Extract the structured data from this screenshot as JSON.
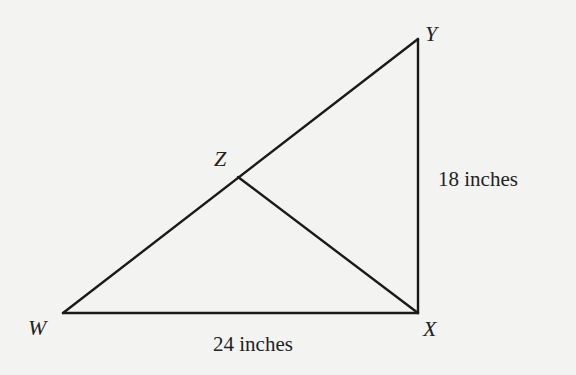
{
  "diagram": {
    "type": "triangle",
    "vertices": {
      "W": {
        "label": "W",
        "x": 63,
        "y": 313
      },
      "X": {
        "label": "X",
        "x": 418,
        "y": 313
      },
      "Y": {
        "label": "Y",
        "x": 418,
        "y": 39
      },
      "Z": {
        "label": "Z",
        "x": 238,
        "y": 177
      }
    },
    "segments": [
      "WX",
      "XY",
      "WY",
      "ZX"
    ],
    "measurements": {
      "WX": "24 inches",
      "XY": "18 inches"
    },
    "colors": {
      "line": "#1a1a1a",
      "background": "#f3f3f1"
    }
  }
}
